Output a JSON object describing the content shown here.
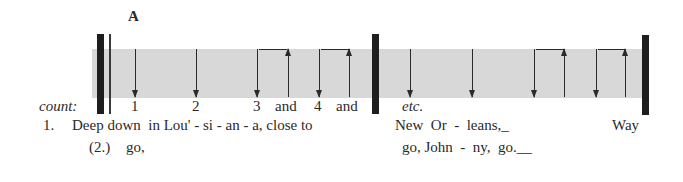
{
  "section_label": "A",
  "count_label": "count:",
  "measure1": {
    "counts": [
      "1",
      "2",
      "3",
      "and",
      "4",
      "and"
    ]
  },
  "measure2": {
    "counts": [
      "etc."
    ]
  },
  "lyrics": {
    "verse1_number": "1.",
    "verse1_part1": "Deep down  in Lou' - si - an - a, close to",
    "verse1_part2": "New  Or  -  leans,_",
    "verse1_part3": "Way",
    "verse2_number": "(2.)",
    "verse2_part1": "go,",
    "verse2_part2": "go, John  -  ny,  go.__"
  },
  "colors": {
    "band": "#d8d8d8",
    "ink": "#1e1e1e"
  }
}
